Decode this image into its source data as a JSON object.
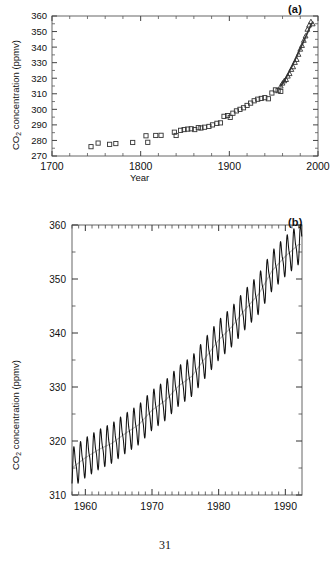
{
  "page": {
    "number": "31"
  },
  "panels": [
    {
      "tag": "(a)",
      "ylabel_pre": "CO",
      "ylabel_sub": "2",
      "ylabel_post": " concentration (ppmv)",
      "xlabel": "Year"
    },
    {
      "tag": "(b)",
      "ylabel_pre": "CO",
      "ylabel_sub": "2",
      "ylabel_post": " concentration (ppmv)",
      "xlabel": ""
    }
  ],
  "chart_data": [
    {
      "type": "scatter",
      "title": "",
      "panel": "(a)",
      "xlabel": "Year",
      "ylabel": "CO2 concentration (ppmv)",
      "xlim": [
        1700,
        2000
      ],
      "ylim": [
        270,
        360
      ],
      "xticks": [
        1700,
        1800,
        1900,
        2000
      ],
      "yticks": [
        270,
        280,
        290,
        300,
        310,
        320,
        330,
        340,
        350,
        360
      ],
      "xminor_step": 20,
      "yminor_step": 5,
      "grid": false,
      "legend": "none",
      "series": [
        {
          "name": "Ice core (Siple / Law Dome) CO2",
          "marker": "open-square",
          "x": [
            1744,
            1752,
            1765,
            1772,
            1791,
            1806,
            1808,
            1817,
            1823,
            1838,
            1840,
            1845,
            1849,
            1853,
            1857,
            1861,
            1865,
            1868,
            1872,
            1877,
            1881,
            1886,
            1890,
            1894,
            1898,
            1901,
            1904,
            1908,
            1912,
            1916,
            1920,
            1924,
            1928,
            1932,
            1936,
            1940,
            1944,
            1948,
            1952,
            1955,
            1958
          ],
          "y": [
            276.0,
            278.3,
            277.5,
            278.0,
            278.7,
            283.0,
            278.8,
            283.2,
            283.3,
            285.3,
            283.2,
            286.5,
            287.0,
            287.3,
            287.5,
            287.0,
            288.2,
            288.0,
            288.5,
            289.0,
            290.0,
            291.0,
            291.3,
            295.5,
            296.0,
            294.8,
            297.5,
            299.0,
            300.0,
            301.0,
            302.5,
            304.0,
            305.5,
            306.5,
            307.0,
            307.5,
            306.8,
            310.5,
            312.5,
            312.0,
            311.5
          ]
        },
        {
          "name": "Mauna Loa direct measurement CO2",
          "marker": "open-triangle",
          "x": [
            1958,
            1960,
            1962,
            1964,
            1966,
            1968,
            1970,
            1972,
            1974,
            1976,
            1978,
            1980,
            1982,
            1984,
            1986,
            1988,
            1990,
            1992,
            1994
          ],
          "y": [
            315.0,
            316.9,
            318.4,
            319.2,
            321.4,
            323.0,
            325.7,
            327.4,
            330.2,
            332.1,
            335.4,
            338.7,
            341.1,
            344.4,
            347.2,
            351.5,
            354.2,
            356.4,
            355.0
          ]
        }
      ]
    },
    {
      "type": "line",
      "title": "",
      "panel": "(b)",
      "xlabel": "",
      "ylabel": "CO2 concentration (ppmv)",
      "xlim": [
        1958,
        1992.5
      ],
      "ylim": [
        310,
        360
      ],
      "xticks": [
        1960,
        1970,
        1980,
        1990
      ],
      "yticks": [
        310,
        320,
        330,
        340,
        350,
        360
      ],
      "xminor_step": 1,
      "yminor_step": 5,
      "grid": false,
      "legend": "none",
      "description": "Mauna Loa Keeling curve: monthly mean CO2 with seasonal cycle plus smoothed annual trend",
      "series": [
        {
          "name": "Monthly mean CO2",
          "style": "sawtooth",
          "seasonal_amplitude_ppmv": 3.2,
          "x": [
            1958,
            1959,
            1960,
            1961,
            1962,
            1963,
            1964,
            1965,
            1966,
            1967,
            1968,
            1969,
            1970,
            1971,
            1972,
            1973,
            1974,
            1975,
            1976,
            1977,
            1978,
            1979,
            1980,
            1981,
            1982,
            1983,
            1984,
            1985,
            1986,
            1987,
            1988,
            1989,
            1990,
            1991,
            1992
          ],
          "y": [
            315.0,
            315.8,
            316.9,
            317.6,
            318.4,
            319.0,
            319.6,
            320.0,
            321.4,
            322.2,
            323.0,
            324.6,
            325.7,
            326.3,
            327.5,
            329.7,
            330.2,
            331.1,
            332.0,
            333.8,
            335.4,
            336.8,
            338.7,
            340.1,
            341.2,
            342.8,
            344.4,
            345.9,
            347.2,
            349.0,
            351.5,
            352.9,
            354.2,
            355.6,
            356.4
          ]
        },
        {
          "name": "Smoothed trend (seasonally adjusted)",
          "style": "smooth",
          "x": [
            1958,
            1960,
            1962,
            1964,
            1966,
            1968,
            1970,
            1972,
            1974,
            1976,
            1978,
            1980,
            1982,
            1984,
            1986,
            1988,
            1990,
            1992
          ],
          "y": [
            315.0,
            316.9,
            318.4,
            319.6,
            321.4,
            323.0,
            325.7,
            327.5,
            330.2,
            332.0,
            335.4,
            338.7,
            341.2,
            344.4,
            347.2,
            351.5,
            354.2,
            356.4
          ]
        }
      ]
    }
  ]
}
